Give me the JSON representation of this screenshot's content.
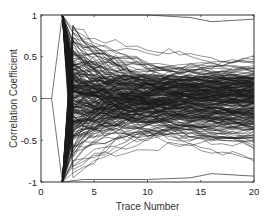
{
  "chart_data": {
    "type": "line",
    "title": "",
    "xlabel": "Trace Number",
    "ylabel": "Correlation Coefficient",
    "xlim": [
      0,
      20
    ],
    "ylim": [
      -1,
      1
    ],
    "xticks": [
      0,
      5,
      10,
      15,
      20
    ],
    "xtick_labels": [
      "0",
      "5",
      "10",
      "15",
      "20"
    ],
    "yticks": [
      1,
      0.5,
      0,
      -0.5,
      -1
    ],
    "ytick_labels": [
      "1",
      "0.5",
      "0",
      "-0.5",
      "-1"
    ],
    "grid": false,
    "legend": null,
    "line_color": "#1a1a1a",
    "series_summary": {
      "num_series": 256,
      "x": [
        1,
        2,
        3,
        4,
        5,
        6,
        8,
        10,
        12,
        14,
        16,
        18,
        20
      ],
      "value_at_trace_1": 0,
      "values_at_trace_2": [
        1,
        -1
      ],
      "bundle_upper_envelope": [
        0,
        1,
        1,
        1,
        0.95,
        0.9,
        0.85,
        0.82,
        0.8,
        0.78,
        0.78,
        0.77,
        0.77
      ],
      "bundle_lower_envelope": [
        0,
        -1,
        -1,
        -1,
        -0.95,
        -0.92,
        -0.88,
        -0.86,
        -0.84,
        -0.82,
        -0.8,
        -0.8,
        -0.8
      ],
      "upper_outlier": {
        "x": [
          2,
          10,
          14,
          16,
          20
        ],
        "y": [
          1,
          1,
          0.97,
          0.92,
          0.95
        ]
      },
      "lower_outlier": {
        "x": [
          2,
          4,
          10,
          14,
          16,
          20
        ],
        "y": [
          -1,
          -0.97,
          -0.97,
          -0.95,
          -0.9,
          -0.93
        ]
      }
    }
  },
  "plot": {
    "left": 41,
    "right": 254,
    "top": 15,
    "bottom": 182,
    "num_lines": 256,
    "seed": 12345
  }
}
